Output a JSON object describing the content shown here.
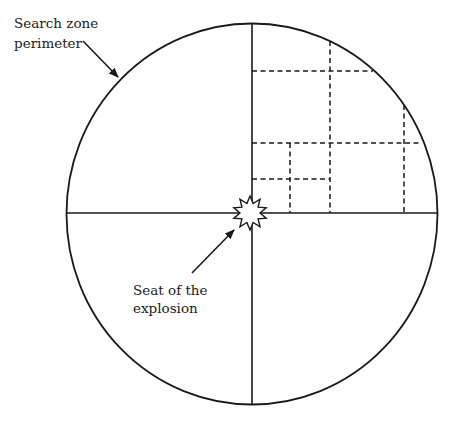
{
  "diagram": {
    "type": "search-zone-diagram",
    "colors": {
      "stroke": "#1a1a1a",
      "text": "#222222",
      "background": "#ffffff"
    },
    "perimeter": {
      "cx": 252,
      "cy": 214,
      "rx": 185.5,
      "ry": 190.5
    },
    "axes": {
      "vertical": {
        "x": 252,
        "y1": 24,
        "y2": 405
      },
      "horizontal": {
        "y": 213,
        "x1": 66,
        "x2": 437
      }
    },
    "search_grid_dashed": [
      {
        "x1": 252,
        "y1": 71,
        "x2": 373,
        "y2": 71
      },
      {
        "x1": 330,
        "y1": 41,
        "x2": 330,
        "y2": 213
      },
      {
        "x1": 252,
        "y1": 143,
        "x2": 422,
        "y2": 143
      },
      {
        "x1": 404,
        "y1": 105,
        "x2": 404,
        "y2": 213
      },
      {
        "x1": 252,
        "y1": 179,
        "x2": 330,
        "y2": 179
      },
      {
        "x1": 290,
        "y1": 143,
        "x2": 290,
        "y2": 213
      }
    ],
    "explosion_marker": {
      "cx": 250,
      "cy": 213,
      "outer_r": 17,
      "inner_r": 10,
      "points": 10
    }
  },
  "labels": {
    "perimeter_label": {
      "line1": "Search zone",
      "line2": "perimeter",
      "arrow": {
        "x1": 83,
        "y1": 41,
        "x2": 118,
        "y2": 77
      }
    },
    "explosion_label": {
      "line1": "Seat of the",
      "line2": "explosion",
      "arrow": {
        "x1": 192,
        "y1": 273,
        "x2": 234,
        "y2": 230
      }
    }
  }
}
